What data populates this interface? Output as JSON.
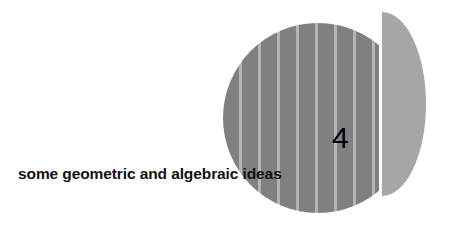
{
  "page": {
    "kind": "book-chapter-opener",
    "background_color": "#ffffff"
  },
  "chapter": {
    "number": "4",
    "title": "some geometric and algebraic ideas",
    "number_color": "#000000",
    "title_color": "#111111"
  },
  "graphic": {
    "name": "striped-circle-with-offset-half-disc",
    "dark_disc": {
      "fill_color": "#808080",
      "stripe_color": "#b5b5b5",
      "stripe_count": 8,
      "clipped_edge": "right"
    },
    "light_half_disc": {
      "fill_color": "#a6a6a6",
      "flat_edge": "left"
    }
  }
}
